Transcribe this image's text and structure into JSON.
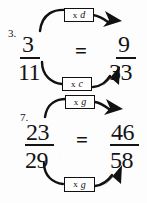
{
  "document": {
    "type": "math-worksheet-scan",
    "title": "Equivalent fractions with multiplication arrows",
    "ink_color": "#141414",
    "paper_color": "#fdfdfd"
  },
  "problems": [
    {
      "label": "3.",
      "left": {
        "numerator": "3",
        "denominator": "11"
      },
      "relation": "=",
      "right": {
        "numerator": "9",
        "denominator": "33"
      },
      "top_arrow": {
        "operator": "x",
        "value": "d",
        "from": "3",
        "to": "9",
        "direction": "left-to-right"
      },
      "bottom_arrow": {
        "operator": "x",
        "value": "c",
        "from": "11",
        "to": "33",
        "direction": "left-to-right"
      }
    },
    {
      "label": "7.",
      "left": {
        "numerator": "23",
        "denominator": "29"
      },
      "relation": "=",
      "right": {
        "numerator": "46",
        "denominator": "58"
      },
      "top_arrow": {
        "operator": "x",
        "value": "g",
        "from": "23",
        "to": "46",
        "direction": "left-to-right"
      },
      "bottom_arrow": {
        "operator": "x",
        "value": "g",
        "from": "29",
        "to": "58",
        "direction": "left-to-right"
      }
    }
  ]
}
